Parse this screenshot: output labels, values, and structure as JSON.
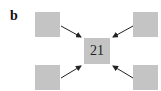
{
  "panel": {
    "label": "b"
  },
  "center_node": {
    "value": "21",
    "color": "#c4c4c4"
  },
  "outer_nodes": [
    {
      "position": "top-left",
      "value": ""
    },
    {
      "position": "top-right",
      "value": ""
    },
    {
      "position": "bottom-left",
      "value": ""
    },
    {
      "position": "bottom-right",
      "value": ""
    }
  ],
  "edges": [
    {
      "from": "top-left",
      "to": "center"
    },
    {
      "from": "top-right",
      "to": "center"
    },
    {
      "from": "bottom-left",
      "to": "center"
    },
    {
      "from": "bottom-right",
      "to": "center"
    }
  ],
  "colors": {
    "node_fill": "#c4c4c4",
    "arrow": "#222222"
  }
}
